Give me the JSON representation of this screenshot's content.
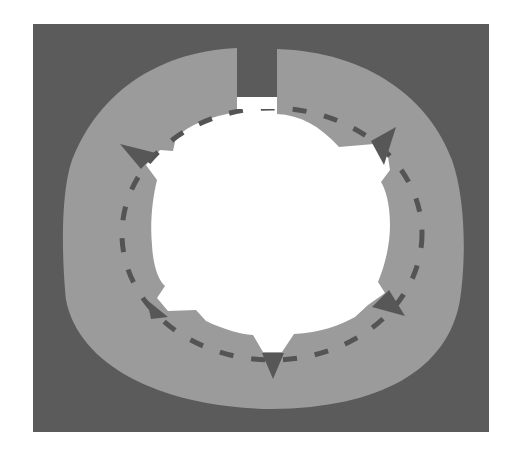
{
  "diagram": {
    "type": "circular-flow",
    "colors": {
      "page_background": "#ffffff",
      "frame_background": "#5b5b5b",
      "ring_fill": "#9b9b9b",
      "inner_fill": "#ffffff",
      "dash_color": "#545454",
      "marker_color": "#575757"
    },
    "frame": {
      "x": 33,
      "y": 24,
      "width": 456,
      "height": 408
    },
    "ring": {
      "left": 62,
      "top": 48,
      "right": 464,
      "bottom": 409,
      "gap_left": 237,
      "gap_right": 277
    },
    "inner_hole": {
      "cx": 272,
      "cy": 232,
      "r": 118
    },
    "dashed_path": {
      "cx": 272,
      "cy": 234,
      "rx": 150,
      "ry": 126,
      "dash": 14,
      "gap": 18
    },
    "markers": [
      {
        "name": "marker-top-left",
        "points": "120,144 156,153 140,168"
      },
      {
        "name": "marker-top-right",
        "points": "372,142 396,127 384,165"
      },
      {
        "name": "marker-right-bottom",
        "points": "372,307 389,290 404,316"
      },
      {
        "name": "marker-bottom",
        "points": "262,353 283,353 273,379"
      },
      {
        "name": "marker-bottom-left",
        "points": "147,300 167,317 152,318"
      }
    ]
  }
}
